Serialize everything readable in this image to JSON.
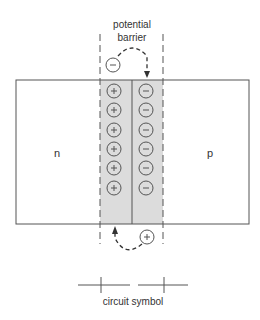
{
  "diagram": {
    "title_line1": "potential",
    "title_line2": "barrier",
    "n_label": "n",
    "p_label": "p",
    "caption": "circuit symbol",
    "plus_sign": "+",
    "minus_sign": "−",
    "rows": 6,
    "colors": {
      "stroke": "#555555",
      "depletion_fill": "#dcdcdc",
      "text": "#333333"
    }
  }
}
